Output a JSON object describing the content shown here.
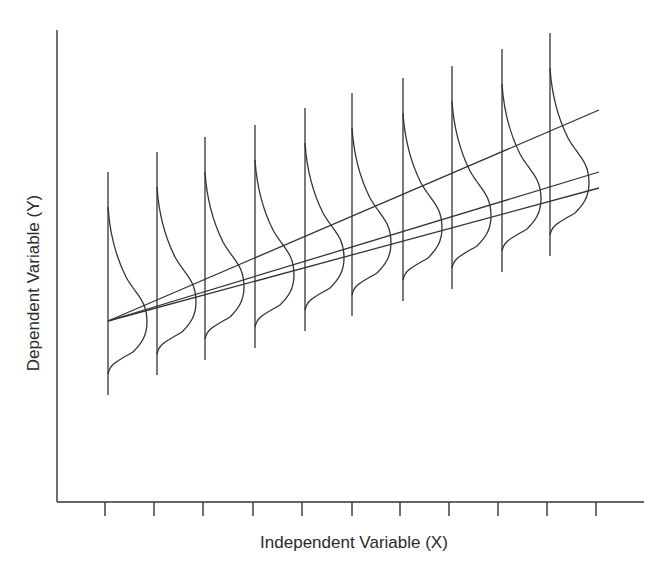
{
  "figure": {
    "x_axis_label": "Independent Variable (X)",
    "y_axis_label": "Dependent Variable (Y)",
    "colors": {
      "ink": "#333333",
      "background": "#ffffff"
    }
  },
  "chart_data": {
    "type": "diagram",
    "title": "",
    "xlabel": "Independent Variable (X)",
    "ylabel": "Dependent Variable (Y)",
    "x_ticks": 11,
    "tick_labels": [],
    "conditional_distributions": {
      "count": 10,
      "shape": "skewed density curve drawn sideways on a vertical baseline at each X tick",
      "description": "Distribution of Y at each level of X; location shifts upward as X increases"
    },
    "regression_lines": {
      "count": 3,
      "common_origin": "left-most distribution",
      "description": "Three fitted lines fanning out from a common starting point, with differing slopes"
    },
    "grid": false,
    "legend": false
  }
}
